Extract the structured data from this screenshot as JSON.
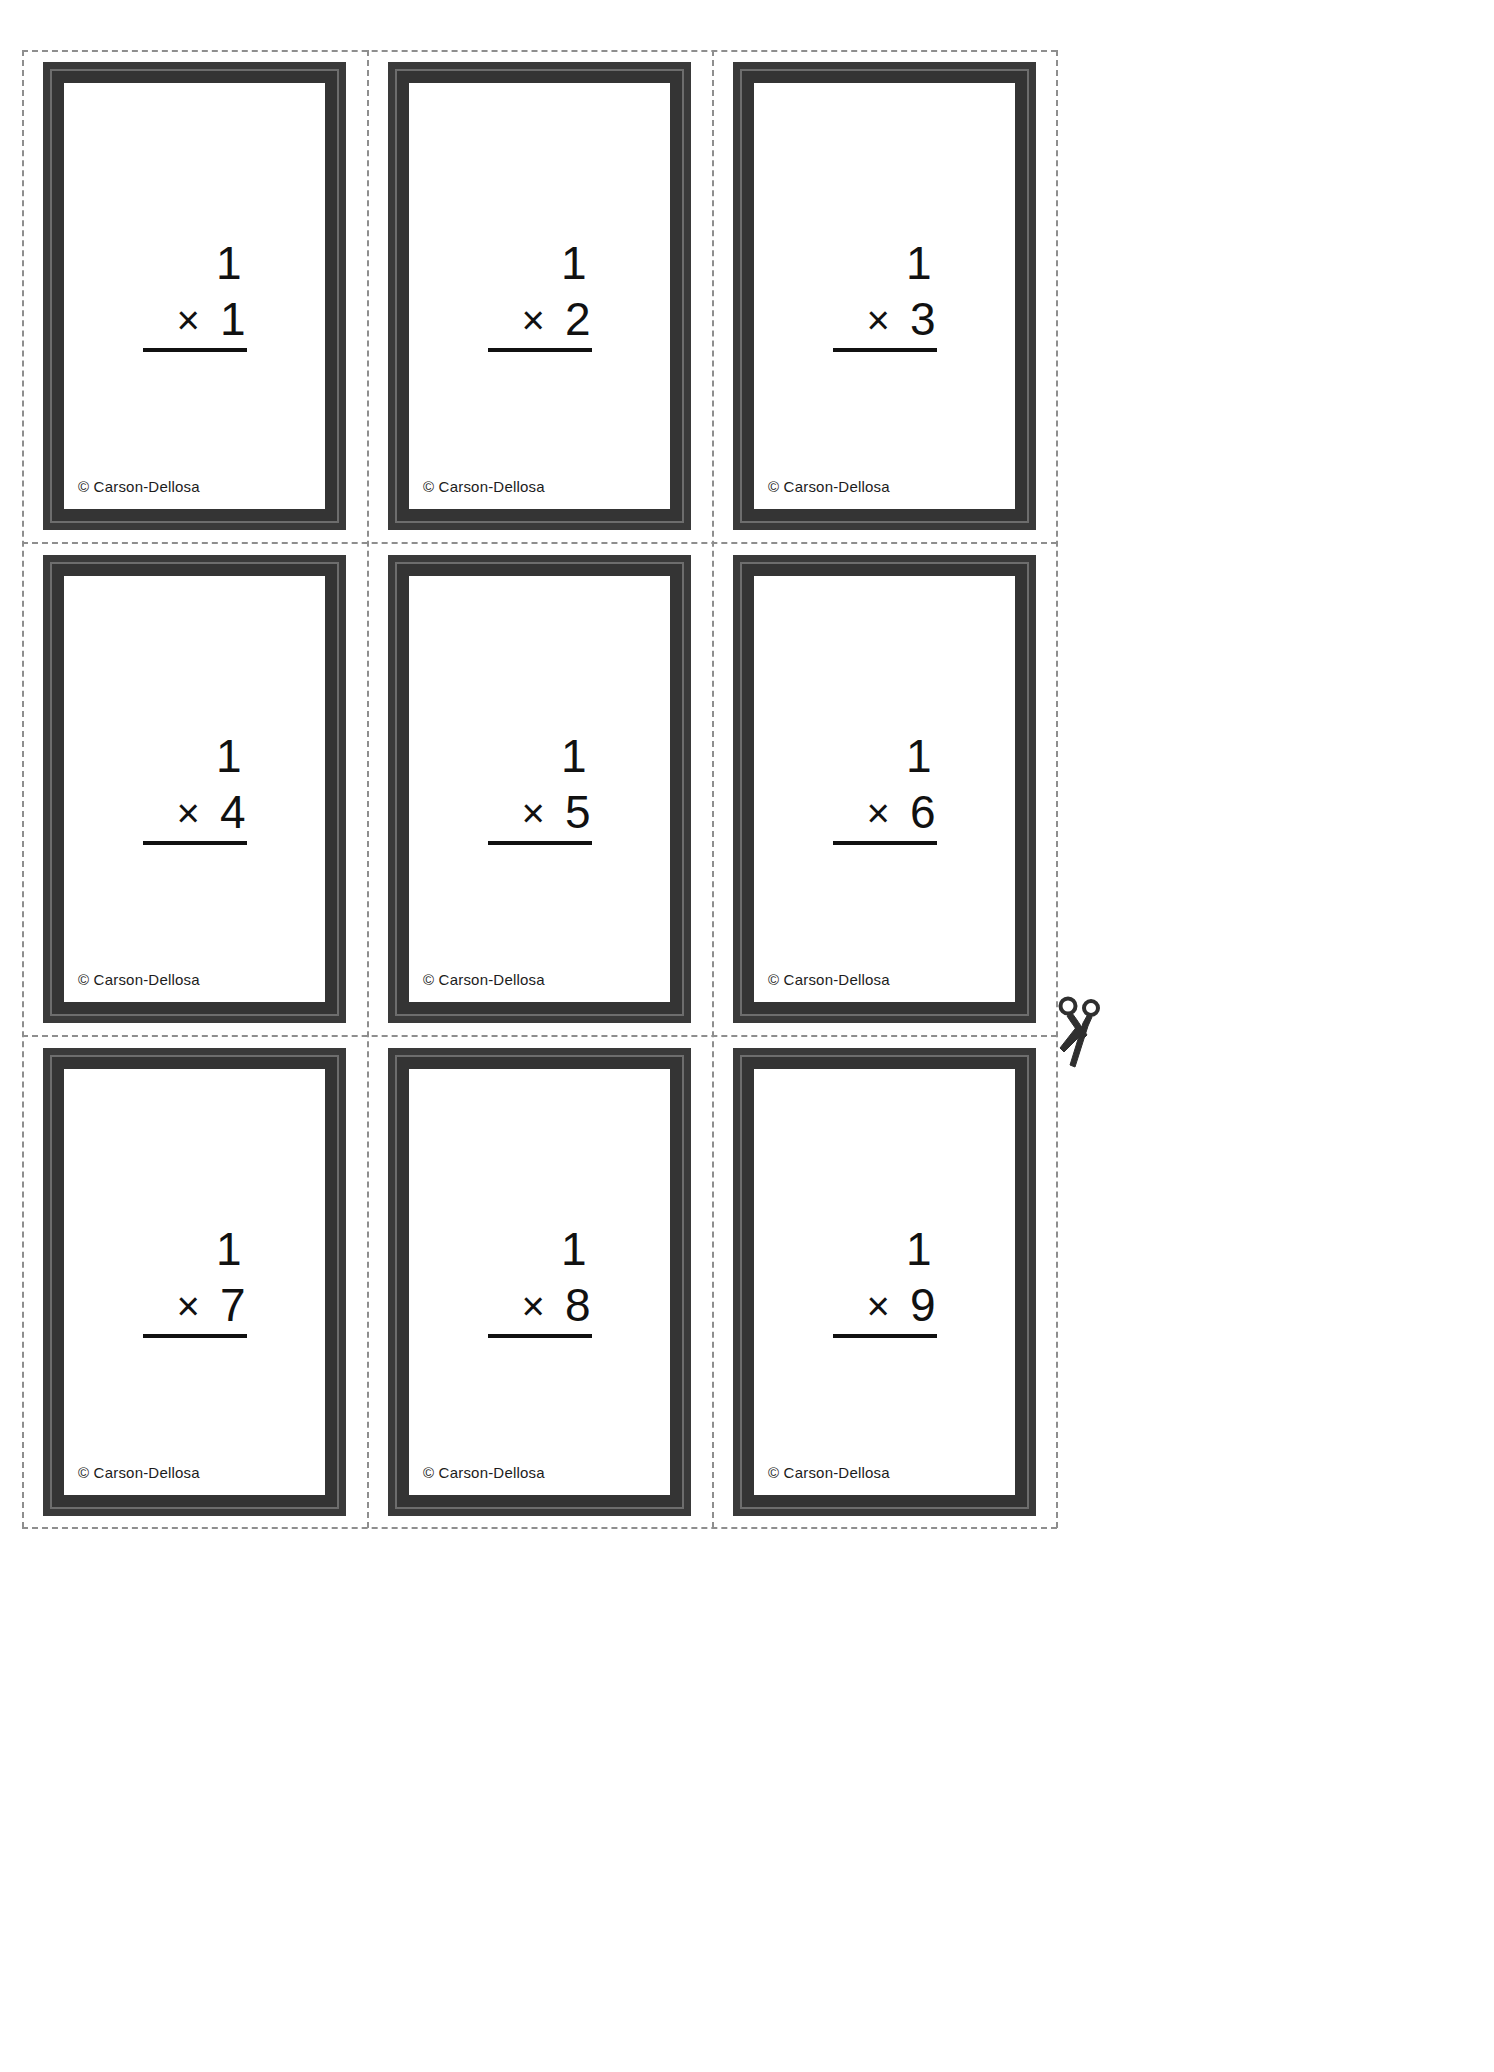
{
  "page": {
    "background_color": "#ffffff",
    "card_frame_color": "#3a3a3a",
    "card_inner_rule_color": "#6d6d6d",
    "cut_line_color": "#8e8e8e",
    "text_color": "#111111"
  },
  "copyright": {
    "text": "© Carson-Dellosa"
  },
  "icons": {
    "scissors": "scissors-icon"
  },
  "problem": {
    "operator": "×"
  },
  "cards": [
    {
      "multiplicand": "1",
      "operator": "×",
      "multiplier": "1",
      "copyright": "© Carson-Dellosa"
    },
    {
      "multiplicand": "1",
      "operator": "×",
      "multiplier": "2",
      "copyright": "© Carson-Dellosa"
    },
    {
      "multiplicand": "1",
      "operator": "×",
      "multiplier": "3",
      "copyright": "© Carson-Dellosa"
    },
    {
      "multiplicand": "1",
      "operator": "×",
      "multiplier": "4",
      "copyright": "© Carson-Dellosa"
    },
    {
      "multiplicand": "1",
      "operator": "×",
      "multiplier": "5",
      "copyright": "© Carson-Dellosa"
    },
    {
      "multiplicand": "1",
      "operator": "×",
      "multiplier": "6",
      "copyright": "© Carson-Dellosa"
    },
    {
      "multiplicand": "1",
      "operator": "×",
      "multiplier": "7",
      "copyright": "© Carson-Dellosa"
    },
    {
      "multiplicand": "1",
      "operator": "×",
      "multiplier": "8",
      "copyright": "© Carson-Dellosa"
    },
    {
      "multiplicand": "1",
      "operator": "×",
      "multiplier": "9",
      "copyright": "© Carson-Dellosa"
    }
  ]
}
